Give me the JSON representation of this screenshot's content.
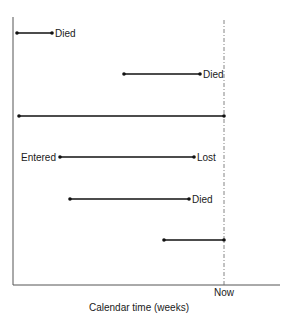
{
  "diagram": {
    "type": "study-timeline",
    "x_axis_label": "Calendar time (weeks)",
    "now_label": "Now",
    "colors": {
      "line": "#111111",
      "axis": "#555555",
      "now_line": "#666666",
      "text": "#1a1a1a"
    },
    "subjects": [
      {
        "row": 1,
        "start_x": 17,
        "end_x": 52,
        "y": 33,
        "start_label": "",
        "end_label": "Died"
      },
      {
        "row": 2,
        "start_x": 124,
        "end_x": 200,
        "y": 74,
        "start_label": "",
        "end_label": "Died"
      },
      {
        "row": 3,
        "start_x": 19,
        "end_x": 224,
        "y": 116,
        "start_label": "",
        "end_label": ""
      },
      {
        "row": 4,
        "start_x": 60,
        "end_x": 194,
        "y": 157,
        "start_label": "Entered",
        "end_label": "Lost"
      },
      {
        "row": 5,
        "start_x": 70,
        "end_x": 189,
        "y": 199,
        "start_label": "",
        "end_label": "Died"
      },
      {
        "row": 6,
        "start_x": 164,
        "end_x": 224,
        "y": 240,
        "start_label": "",
        "end_label": ""
      }
    ]
  }
}
